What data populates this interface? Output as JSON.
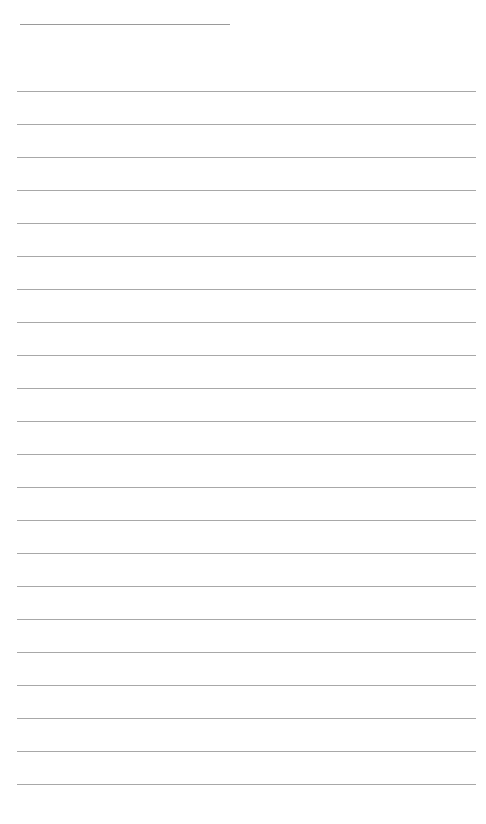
{
  "page": {
    "type": "lined-paper",
    "background_color": "#ffffff",
    "line_color": "#a8a8a8",
    "title_line": {
      "x": 20,
      "y": 24,
      "width": 210
    },
    "rules": {
      "count": 22,
      "start_y": 91,
      "spacing": 33,
      "x": 17,
      "width": 459
    }
  }
}
